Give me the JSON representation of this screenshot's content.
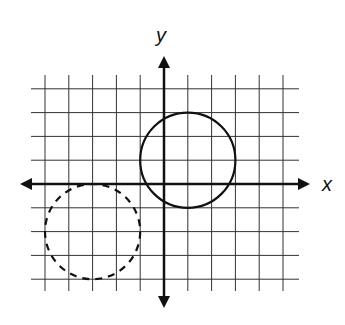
{
  "diagram": {
    "type": "coordinate-plane",
    "axis_labels": {
      "x": "x",
      "y": "y"
    },
    "grid": {
      "x_range": [
        -5,
        5
      ],
      "y_range": [
        -4,
        4
      ],
      "unit_px": 23.8,
      "origin_px": [
        164,
        184
      ]
    },
    "shapes": [
      {
        "name": "solid-circle",
        "style": "solid",
        "center": [
          1,
          1
        ],
        "radius": 2
      },
      {
        "name": "dashed-circle",
        "style": "dashed",
        "center": [
          -3,
          -2
        ],
        "radius": 2
      }
    ],
    "colors": {
      "line": "#111111",
      "grid": "#333333",
      "background": "#ffffff"
    }
  }
}
